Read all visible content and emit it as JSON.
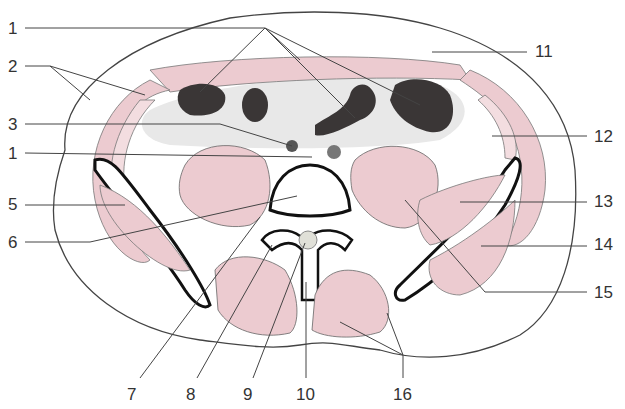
{
  "diagram": {
    "colors": {
      "muscle": "#eccbd0",
      "bowel_gas": "#3a3636",
      "bone_outline": "#111111",
      "fat": "#e6e6e6",
      "line": "#444444"
    },
    "labels": [
      {
        "id": "1",
        "text": "1",
        "x": 8,
        "y": 20
      },
      {
        "id": "2",
        "text": "2",
        "x": 8,
        "y": 60
      },
      {
        "id": "3",
        "text": "3",
        "x": 8,
        "y": 117
      },
      {
        "id": "4",
        "text": "1",
        "x": 8,
        "y": 145
      },
      {
        "id": "5",
        "text": "5",
        "x": 8,
        "y": 195
      },
      {
        "id": "6",
        "text": "6",
        "x": 8,
        "y": 233
      },
      {
        "id": "7",
        "text": "7",
        "x": 127,
        "y": 386
      },
      {
        "id": "8",
        "text": "8",
        "x": 187,
        "y": 386
      },
      {
        "id": "9",
        "text": "9",
        "x": 243,
        "y": 386
      },
      {
        "id": "10",
        "text": "10",
        "x": 297,
        "y": 386
      },
      {
        "id": "11",
        "text": "11",
        "x": 534,
        "y": 43
      },
      {
        "id": "12",
        "text": "12",
        "x": 594,
        "y": 128
      },
      {
        "id": "13",
        "text": "13",
        "x": 594,
        "y": 193
      },
      {
        "id": "14",
        "text": "14",
        "x": 594,
        "y": 235
      },
      {
        "id": "15",
        "text": "15",
        "x": 594,
        "y": 284
      },
      {
        "id": "16",
        "text": "16",
        "x": 393,
        "y": 386
      }
    ]
  }
}
